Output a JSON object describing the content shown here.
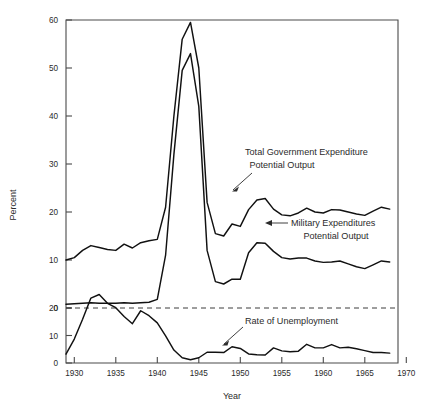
{
  "figure": {
    "ylabel": "Percent",
    "xlabel": "Year",
    "background": "#ffffff",
    "line_color": "#111111"
  },
  "axes": {
    "x_ticks": [
      "1930",
      "1935",
      "1940",
      "1945",
      "1950",
      "1955",
      "1960",
      "1965",
      "1970"
    ],
    "y_ticks_upper": [
      "0",
      "10",
      "20",
      "30",
      "40",
      "50",
      "60"
    ],
    "y_ticks_lower": [
      "0",
      "10",
      "20"
    ]
  },
  "annotations": {
    "total_line1": "Total Government Expenditure",
    "total_line2": "Potential Output",
    "military_line1": "Military Expenditures",
    "military_line2": "Potential Output",
    "unemployment": "Rate of Unemployment"
  },
  "chart_data": {
    "type": "line",
    "title": "",
    "xlabel": "Year",
    "ylabel": "Percent",
    "xlim": [
      1929,
      1969
    ],
    "grid": false,
    "legend": "annotations-inline",
    "axis_note": "Dual overlapping scales: expenditure ratios use 0-60 scale; unemployment uses 0-20 scale whose 20 aligns with the expenditure 0 dashed baseline.",
    "ylim_upper": [
      0,
      60
    ],
    "ylim_lower": [
      0,
      20
    ],
    "series": [
      {
        "name": "Total Government Expenditure / Potential Output",
        "scale": "upper",
        "x": [
          1929,
          1930,
          1931,
          1932,
          1933,
          1934,
          1935,
          1936,
          1937,
          1938,
          1939,
          1940,
          1941,
          1942,
          1943,
          1944,
          1945,
          1946,
          1947,
          1948,
          1949,
          1950,
          1951,
          1952,
          1953,
          1954,
          1955,
          1956,
          1957,
          1958,
          1959,
          1960,
          1961,
          1962,
          1963,
          1964,
          1965,
          1966,
          1967,
          1968
        ],
        "values": [
          10.0,
          10.5,
          12.0,
          13.0,
          12.6,
          12.2,
          12.0,
          13.3,
          12.5,
          13.6,
          14.0,
          14.3,
          21.0,
          40.0,
          56.0,
          59.5,
          50.0,
          22.0,
          15.5,
          15.0,
          17.5,
          17.0,
          20.5,
          22.5,
          22.8,
          20.6,
          19.4,
          19.2,
          19.8,
          20.8,
          20.0,
          19.8,
          20.5,
          20.4,
          20.0,
          19.6,
          19.3,
          20.2,
          21.0,
          20.6
        ]
      },
      {
        "name": "Military Expenditures / Potential Output",
        "scale": "upper",
        "x": [
          1929,
          1930,
          1931,
          1932,
          1933,
          1934,
          1935,
          1936,
          1937,
          1938,
          1939,
          1940,
          1941,
          1942,
          1943,
          1944,
          1945,
          1946,
          1947,
          1948,
          1949,
          1950,
          1951,
          1952,
          1953,
          1954,
          1955,
          1956,
          1957,
          1958,
          1959,
          1960,
          1961,
          1962,
          1963,
          1964,
          1965,
          1966,
          1967,
          1968
        ],
        "values": [
          0.8,
          0.9,
          1.0,
          1.1,
          1.0,
          1.0,
          1.0,
          1.1,
          1.0,
          1.1,
          1.2,
          1.8,
          11.0,
          32.0,
          49.5,
          53.0,
          42.0,
          12.0,
          5.5,
          5.0,
          6.0,
          6.0,
          11.5,
          13.6,
          13.5,
          11.8,
          10.5,
          10.2,
          10.4,
          10.4,
          9.8,
          9.5,
          9.6,
          9.8,
          9.2,
          8.6,
          8.2,
          9.0,
          9.8,
          9.6
        ]
      },
      {
        "name": "Rate of Unemployment",
        "scale": "lower",
        "x": [
          1929,
          1930,
          1931,
          1932,
          1933,
          1934,
          1935,
          1936,
          1937,
          1938,
          1939,
          1940,
          1941,
          1942,
          1943,
          1944,
          1945,
          1946,
          1947,
          1948,
          1949,
          1950,
          1951,
          1952,
          1953,
          1954,
          1955,
          1956,
          1957,
          1958,
          1959,
          1960,
          1961,
          1962,
          1963,
          1964,
          1965,
          1966,
          1967,
          1968
        ],
        "values": [
          3.2,
          8.7,
          15.9,
          23.6,
          24.9,
          21.7,
          20.1,
          16.9,
          14.3,
          19.0,
          17.2,
          14.6,
          9.9,
          4.7,
          1.9,
          1.2,
          1.9,
          3.9,
          3.9,
          3.8,
          5.9,
          5.3,
          3.3,
          3.0,
          2.9,
          5.5,
          4.4,
          4.1,
          4.3,
          6.8,
          5.5,
          5.5,
          6.7,
          5.5,
          5.7,
          5.2,
          4.5,
          3.8,
          3.8,
          3.6
        ]
      }
    ]
  }
}
